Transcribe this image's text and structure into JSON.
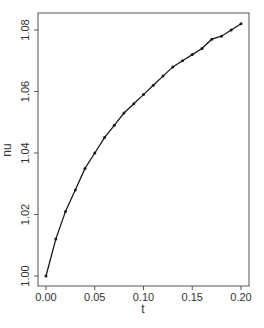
{
  "chart_data": {
    "type": "line",
    "title": "",
    "xlabel": "t",
    "ylabel": "nu",
    "xlim": [
      0.0,
      0.2
    ],
    "ylim": [
      1.0,
      1.082
    ],
    "grid": false,
    "legend": null,
    "x_ticks": [
      "0.00",
      "0.05",
      "0.10",
      "0.15",
      "0.20"
    ],
    "y_ticks": [
      "1.00",
      "1.02",
      "1.04",
      "1.06",
      "1.08"
    ],
    "x": [
      0.0,
      0.01,
      0.02,
      0.03,
      0.04,
      0.05,
      0.06,
      0.07,
      0.08,
      0.09,
      0.1,
      0.11,
      0.12,
      0.13,
      0.14,
      0.15,
      0.16,
      0.17,
      0.18,
      0.19,
      0.2
    ],
    "series": [
      {
        "name": "nu",
        "marker": "point",
        "values": [
          1.0,
          1.012,
          1.021,
          1.028,
          1.035,
          1.04,
          1.045,
          1.049,
          1.053,
          1.056,
          1.059,
          1.062,
          1.065,
          1.068,
          1.07,
          1.072,
          1.074,
          1.077,
          1.078,
          1.08,
          1.082
        ]
      }
    ]
  },
  "style": {
    "line_color": "#1a1a1a",
    "axis_color": "#555555",
    "text_color": "#333333",
    "background": "#ffffff"
  }
}
